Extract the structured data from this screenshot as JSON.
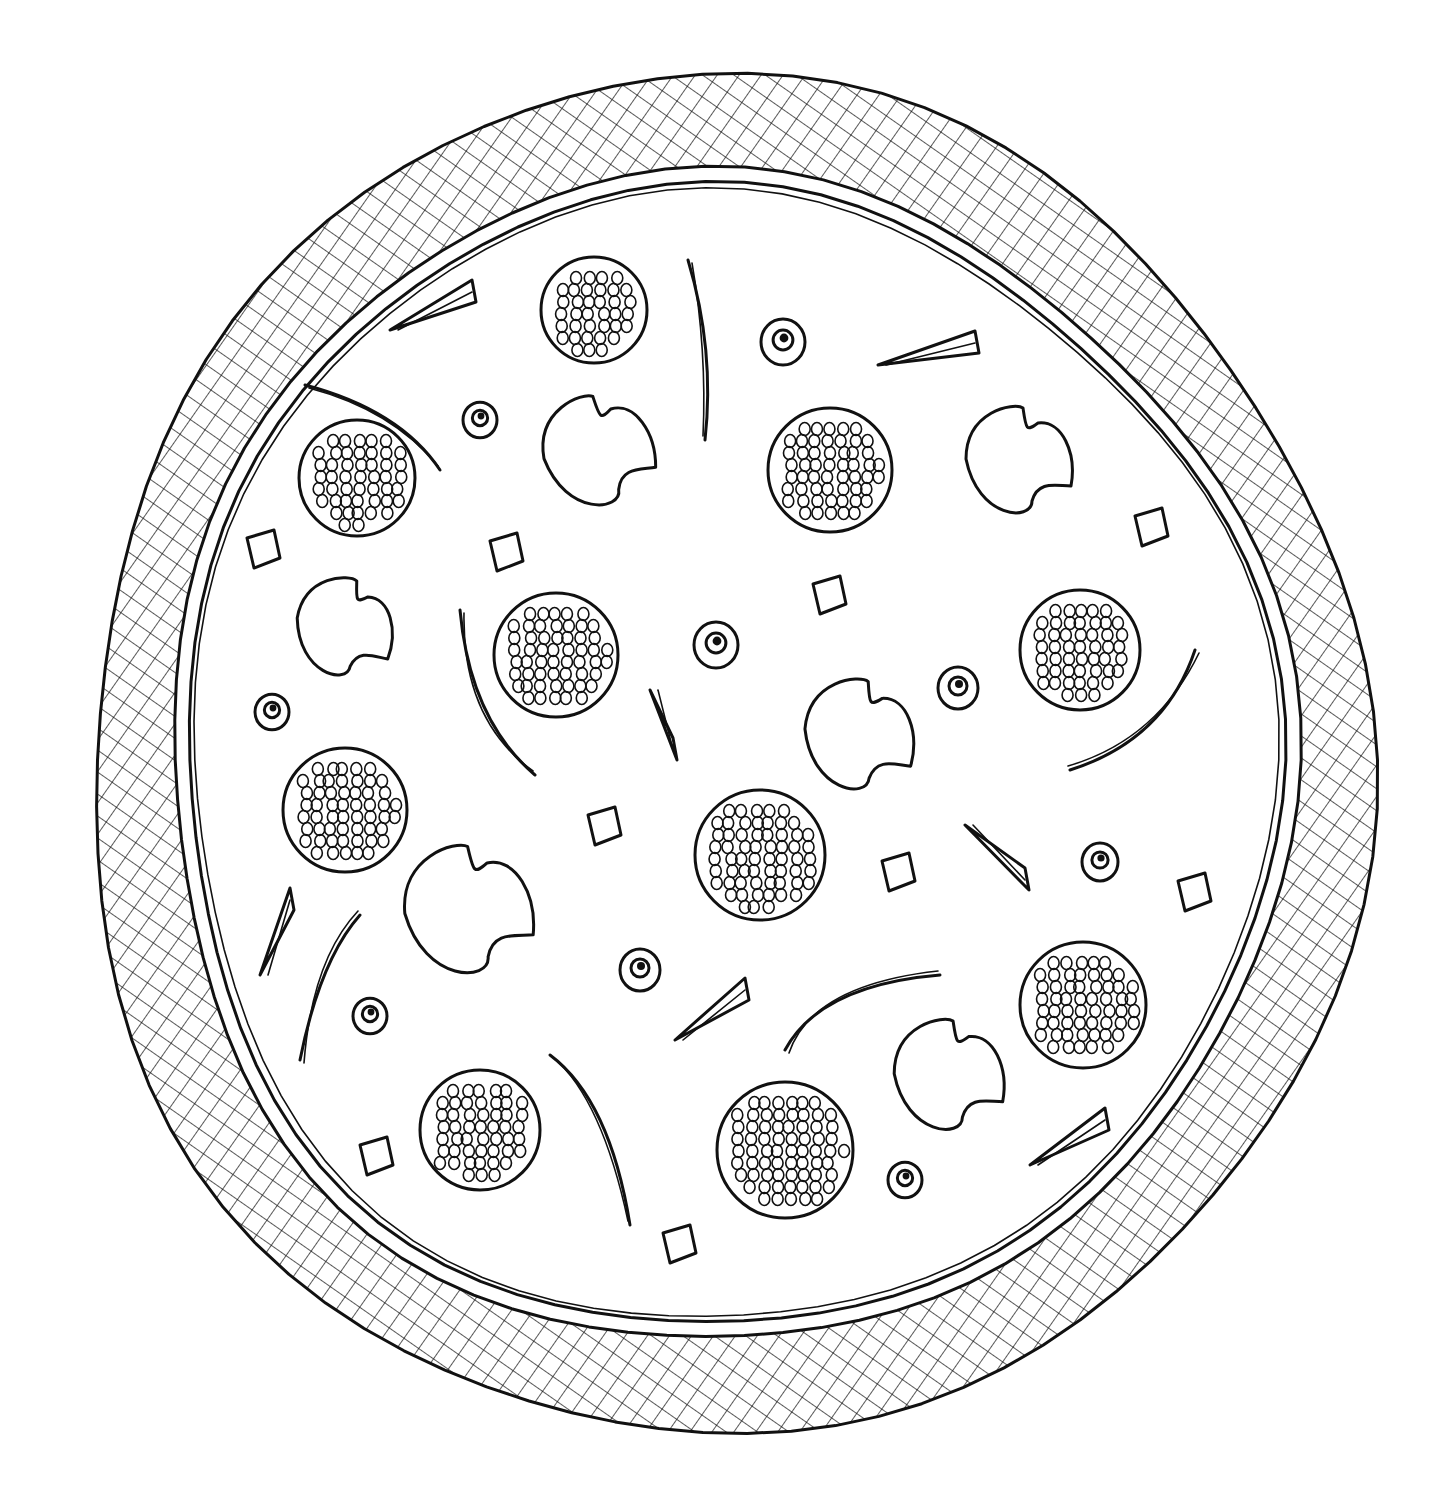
{
  "image": {
    "subject": "pizza line drawing",
    "style": "black ink on white, cross-hatched crust",
    "colors": {
      "background": "#ffffff",
      "ink": "#111111"
    }
  },
  "pizza": {
    "center": [
      725,
      760
    ],
    "crust_outer": [
      640,
      680
    ],
    "crust_inner": [
      548,
      570
    ],
    "pepperoni": [
      [
        594,
        310,
        53
      ],
      [
        357,
        478,
        58
      ],
      [
        830,
        470,
        62
      ],
      [
        556,
        655,
        62
      ],
      [
        1080,
        650,
        60
      ],
      [
        345,
        810,
        62
      ],
      [
        760,
        855,
        65
      ],
      [
        1083,
        1005,
        63
      ],
      [
        480,
        1130,
        60
      ],
      [
        785,
        1150,
        68
      ]
    ],
    "mushrooms": [
      [
        600,
        455,
        62,
        -10
      ],
      [
        345,
        632,
        55,
        10
      ],
      [
        1020,
        465,
        60,
        0
      ],
      [
        860,
        740,
        62,
        5
      ],
      [
        470,
        915,
        72,
        -5
      ],
      [
        950,
        1080,
        62,
        0
      ]
    ],
    "olives": [
      [
        783,
        342,
        22
      ],
      [
        480,
        420,
        17
      ],
      [
        716,
        645,
        22
      ],
      [
        958,
        688,
        20
      ],
      [
        272,
        712,
        17
      ],
      [
        1100,
        862,
        18
      ],
      [
        640,
        970,
        20
      ],
      [
        370,
        1016,
        17
      ],
      [
        905,
        1180,
        17
      ]
    ],
    "peppers": [
      [
        688,
        260,
        715,
        350,
        705,
        440
      ],
      [
        305,
        385,
        400,
        410,
        440,
        470
      ],
      [
        460,
        610,
        470,
        720,
        535,
        775
      ],
      [
        1195,
        650,
        1165,
        740,
        1070,
        770
      ],
      [
        300,
        1060,
        320,
        960,
        360,
        915
      ],
      [
        550,
        1055,
        610,
        1100,
        630,
        1225
      ],
      [
        785,
        1050,
        820,
        985,
        940,
        975
      ]
    ],
    "chunks": [
      [
        262,
        550
      ],
      [
        505,
        553
      ],
      [
        828,
        596
      ],
      [
        1150,
        528
      ],
      [
        603,
        827
      ],
      [
        897,
        873
      ],
      [
        1193,
        893
      ],
      [
        375,
        1157
      ],
      [
        678,
        1245
      ]
    ],
    "wedges": [
      [
        390,
        330,
        472,
        292
      ],
      [
        878,
        365,
        975,
        343
      ],
      [
        650,
        690,
        673,
        750
      ],
      [
        965,
        825,
        1025,
        880
      ],
      [
        260,
        975,
        290,
        900
      ],
      [
        675,
        1040,
        745,
        990
      ],
      [
        1030,
        1165,
        1105,
        1120
      ]
    ]
  }
}
